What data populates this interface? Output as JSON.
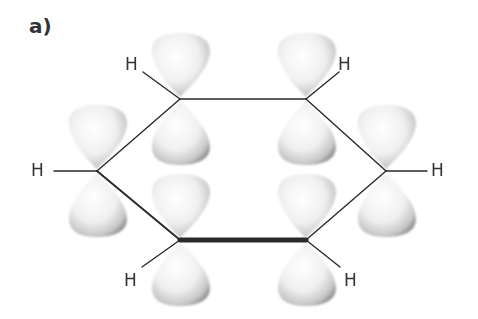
{
  "figure": {
    "panel_label": "a)",
    "hydrogen_label": "H",
    "hydrogens": [
      {
        "label": "H",
        "x": 125,
        "y": 64
      },
      {
        "label": "H",
        "x": 338,
        "y": 64
      },
      {
        "label": "H",
        "x": 33,
        "y": 170
      },
      {
        "label": "H",
        "x": 432,
        "y": 170
      },
      {
        "label": "H",
        "x": 125,
        "y": 280
      },
      {
        "label": "H",
        "x": 344,
        "y": 280
      }
    ],
    "colors": {
      "bond": "#2a2a2a",
      "text": "#333333",
      "lobe_fill": "#f4f4f4",
      "lobe_shade": "#9a9a9a"
    }
  }
}
